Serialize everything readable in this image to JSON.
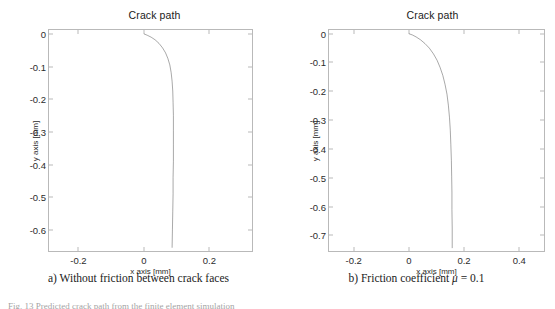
{
  "figure": {
    "caption_partial": "Fig. 13  Predicted crack path from the finite element simulation"
  },
  "panels": [
    {
      "id": "a",
      "title": "Crack path",
      "xlabel": "x axis [mm]",
      "ylabel": "y axis [mm]",
      "subcaption_prefix": "a) Without friction between crack faces",
      "xticks": [
        "-0.2",
        "0",
        "0.2"
      ],
      "yticks": [
        "0",
        "-0.1",
        "-0.2",
        "-0.3",
        "-0.4",
        "-0.5",
        "-0.6"
      ],
      "xlim": [
        -0.29,
        0.33
      ],
      "ylim": [
        -0.665,
        0.012
      ],
      "curve_color": "#3f3f3f"
    },
    {
      "id": "b",
      "title": "Crack path",
      "xlabel": "x axis [mm]",
      "ylabel": "y axis [mm]",
      "subcaption_prefix": "b) Friction coefficient ",
      "subcaption_mu": "μ",
      "subcaption_suffix": " = 0.1",
      "xticks": [
        "-0.2",
        "0",
        "0.2",
        "0.4"
      ],
      "yticks": [
        "0",
        "-0.1",
        "-0.2",
        "-0.3",
        "-0.4",
        "-0.5",
        "-0.6",
        "-0.7"
      ],
      "xlim": [
        -0.29,
        0.49
      ],
      "ylim": [
        -0.755,
        0.013
      ],
      "curve_color": "#3f3f3f"
    }
  ],
  "chart_data": [
    {
      "type": "line",
      "title": "Crack path",
      "xlabel": "x axis [mm]",
      "ylabel": "y axis [mm]",
      "xlim": [
        -0.29,
        0.33
      ],
      "ylim": [
        -0.665,
        0.012
      ],
      "xticks": [
        -0.2,
        0,
        0.2
      ],
      "yticks": [
        0,
        -0.1,
        -0.2,
        -0.3,
        -0.4,
        -0.5,
        -0.6
      ],
      "grid": false,
      "legend": "none",
      "annotation": "a) Without friction between crack faces",
      "series": [
        {
          "name": "crack path (frictionless)",
          "x": [
            0.0,
            0.01,
            0.022,
            0.034,
            0.046,
            0.057,
            0.066,
            0.073,
            0.079,
            0.083,
            0.086,
            0.088,
            0.089,
            0.09,
            0.09,
            0.09,
            0.09,
            0.089,
            0.089,
            0.088,
            0.087,
            0.086
          ],
          "y": [
            0.0,
            -0.004,
            -0.01,
            -0.018,
            -0.029,
            -0.043,
            -0.058,
            -0.075,
            -0.095,
            -0.118,
            -0.145,
            -0.175,
            -0.21,
            -0.25,
            -0.295,
            -0.34,
            -0.39,
            -0.44,
            -0.49,
            -0.545,
            -0.6,
            -0.655
          ]
        }
      ]
    },
    {
      "type": "line",
      "title": "Crack path",
      "xlabel": "x axis [mm]",
      "ylabel": "y axis [mm]",
      "xlim": [
        -0.29,
        0.49
      ],
      "ylim": [
        -0.755,
        0.013
      ],
      "xticks": [
        -0.2,
        0,
        0.2,
        0.4
      ],
      "yticks": [
        0,
        -0.1,
        -0.2,
        -0.3,
        -0.4,
        -0.5,
        -0.6,
        -0.7
      ],
      "grid": false,
      "legend": "none",
      "annotation": "b) Friction coefficient μ = 0.1",
      "series": [
        {
          "name": "crack path (μ = 0.1)",
          "x": [
            0.0,
            0.012,
            0.026,
            0.042,
            0.058,
            0.074,
            0.089,
            0.102,
            0.113,
            0.123,
            0.131,
            0.138,
            0.143,
            0.147,
            0.15,
            0.152,
            0.154,
            0.155,
            0.156,
            0.156,
            0.157,
            0.157
          ],
          "y": [
            0.0,
            -0.004,
            -0.011,
            -0.021,
            -0.034,
            -0.05,
            -0.07,
            -0.092,
            -0.117,
            -0.145,
            -0.176,
            -0.21,
            -0.248,
            -0.29,
            -0.335,
            -0.385,
            -0.44,
            -0.495,
            -0.55,
            -0.61,
            -0.675,
            -0.745
          ]
        }
      ]
    }
  ]
}
